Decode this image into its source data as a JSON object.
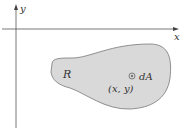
{
  "axes": {
    "x_label": "x",
    "y_label": "y"
  },
  "region": {
    "label": "R",
    "fill": "#d9d9d9",
    "stroke": "#777777"
  },
  "element": {
    "label": "dA",
    "point_label": "(x, y)"
  }
}
